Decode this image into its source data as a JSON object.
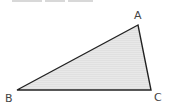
{
  "diagram": {
    "type": "triangle",
    "vertices": [
      {
        "label": "A",
        "x": 138,
        "y": 25
      },
      {
        "label": "B",
        "x": 17,
        "y": 90
      },
      {
        "label": "C",
        "x": 151,
        "y": 90
      }
    ],
    "labels": {
      "A": "A",
      "B": "B",
      "C": "C"
    },
    "colors": {
      "fill": "#e6e6e6",
      "stroke": "#222222",
      "label": "#444444"
    }
  }
}
